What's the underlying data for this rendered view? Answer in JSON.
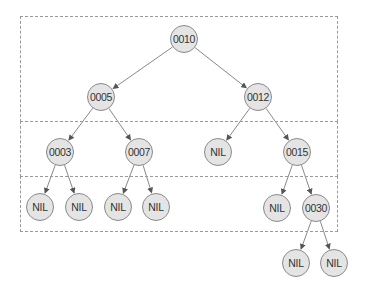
{
  "diagram": {
    "type": "binary-search-tree",
    "colors": {
      "node_fill": "#e4e4e4",
      "node_border": "#8a8a8a",
      "edge": "#7a7a7a",
      "box_border": "#9a9a9a",
      "text": "#333333"
    },
    "level_boxes": [
      {
        "id": "level-0-1",
        "x": 20,
        "y": 16,
        "w": 318,
        "h": 106
      },
      {
        "id": "level-2",
        "x": 20,
        "y": 121,
        "w": 318,
        "h": 56
      },
      {
        "id": "level-3",
        "x": 20,
        "y": 176,
        "w": 318,
        "h": 56
      }
    ],
    "nodes": [
      {
        "id": "n10",
        "label": "0010",
        "x": 184,
        "y": 39
      },
      {
        "id": "n5",
        "label": "0005",
        "x": 101,
        "y": 97
      },
      {
        "id": "n12",
        "label": "0012",
        "x": 258,
        "y": 97
      },
      {
        "id": "n3",
        "label": "0003",
        "x": 60,
        "y": 152
      },
      {
        "id": "n7",
        "label": "0007",
        "x": 139,
        "y": 152
      },
      {
        "id": "nil12l",
        "label": "NIL",
        "x": 218,
        "y": 152
      },
      {
        "id": "n15",
        "label": "0015",
        "x": 297,
        "y": 152
      },
      {
        "id": "nil3l",
        "label": "NIL",
        "x": 40,
        "y": 207
      },
      {
        "id": "nil3r",
        "label": "NIL",
        "x": 79,
        "y": 207
      },
      {
        "id": "nil7l",
        "label": "NIL",
        "x": 118,
        "y": 207
      },
      {
        "id": "nil7r",
        "label": "NIL",
        "x": 156,
        "y": 207
      },
      {
        "id": "nil15l",
        "label": "NIL",
        "x": 277,
        "y": 208
      },
      {
        "id": "n30",
        "label": "0030",
        "x": 316,
        "y": 208
      },
      {
        "id": "nil30l",
        "label": "NIL",
        "x": 296,
        "y": 263
      },
      {
        "id": "nil30r",
        "label": "NIL",
        "x": 334,
        "y": 263
      }
    ],
    "edges": [
      {
        "from": "n10",
        "to": "n5"
      },
      {
        "from": "n10",
        "to": "n12"
      },
      {
        "from": "n5",
        "to": "n3"
      },
      {
        "from": "n5",
        "to": "n7"
      },
      {
        "from": "n12",
        "to": "nil12l"
      },
      {
        "from": "n12",
        "to": "n15"
      },
      {
        "from": "n3",
        "to": "nil3l"
      },
      {
        "from": "n3",
        "to": "nil3r"
      },
      {
        "from": "n7",
        "to": "nil7l"
      },
      {
        "from": "n7",
        "to": "nil7r"
      },
      {
        "from": "n15",
        "to": "nil15l"
      },
      {
        "from": "n15",
        "to": "n30"
      },
      {
        "from": "n30",
        "to": "nil30l"
      },
      {
        "from": "n30",
        "to": "nil30r"
      }
    ]
  }
}
